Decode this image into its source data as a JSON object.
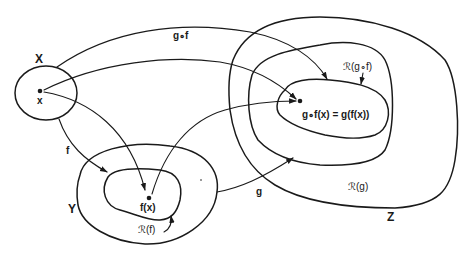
{
  "diagram": {
    "colors": {
      "ink": "#1a1a1a",
      "background": "#ffffff"
    },
    "sets": {
      "X": {
        "label": "X",
        "point_label": "x"
      },
      "Y": {
        "label": "Y",
        "range_label": "ℛ(f)",
        "point_label": "f(x)"
      },
      "Z": {
        "label": "Z",
        "range_g_label": "ℛ(g)",
        "range_gf_label": "ℛ(g∘f)",
        "point_label": "g∘f(x) = g(f(x))"
      }
    },
    "arrows": [
      {
        "name": "f",
        "label": "f",
        "from": "X",
        "to": "ℛ(f)"
      },
      {
        "name": "g",
        "label": "g",
        "from": "Y",
        "to": "ℛ(g)"
      },
      {
        "name": "gof",
        "label": "g∘f",
        "from": "X",
        "to": "ℛ(g∘f)"
      },
      {
        "name": "x-to-fx",
        "label": "",
        "from": "x",
        "to": "f(x)"
      },
      {
        "name": "x-to-gfx",
        "label": "",
        "from": "x",
        "to": "g∘f(x)"
      },
      {
        "name": "fx-to-gfx",
        "label": "",
        "from": "f(x)",
        "to": "g∘f(x)"
      }
    ]
  }
}
